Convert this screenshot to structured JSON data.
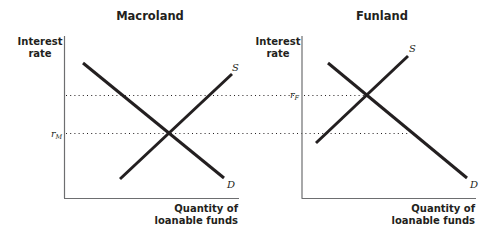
{
  "panels": [
    {
      "title": "Macroland",
      "y_axis_label_line1": "Interest",
      "y_axis_label_line2": "rate",
      "x_axis_label_line1": "Quantity of",
      "x_axis_label_line2": "loanable funds",
      "supply_label": "S",
      "demand_label": "D",
      "rate_label_main": "r",
      "rate_label_sub": "M"
    },
    {
      "title": "Funland",
      "y_axis_label_line1": "Interest",
      "y_axis_label_line2": "rate",
      "x_axis_label_line1": "Quantity of",
      "x_axis_label_line2": "loanable funds",
      "supply_label": "S",
      "demand_label": "D",
      "rate_label_main": "r",
      "rate_label_sub": "F"
    }
  ],
  "colors": {
    "curves": "#231f20",
    "axes": "#6d6e70",
    "background": "#ffffff"
  }
}
